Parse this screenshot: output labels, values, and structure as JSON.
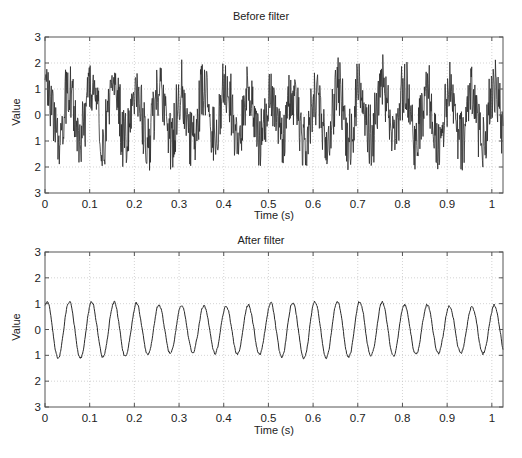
{
  "figure": {
    "width": 522,
    "height": 458,
    "line_color": "#2a2a2a",
    "axis_color": "#555555",
    "grid_color": "#c8c8c8"
  },
  "chart_data": [
    {
      "type": "line",
      "title": "Before filter",
      "xlabel": "Time (s)",
      "ylabel": "Value",
      "xlim": [
        0,
        1.025
      ],
      "ylim": [
        -3,
        3
      ],
      "xticks": [
        0,
        0.1,
        0.2,
        0.3,
        0.4,
        0.5,
        0.6,
        0.7,
        0.8,
        0.9,
        1
      ],
      "xtick_labels": [
        "0",
        "0.1",
        "0.2",
        "0.3",
        "0.4",
        "0.5",
        "0.6",
        "0.7",
        "0.8",
        "0.9",
        "1"
      ],
      "yticks": [
        3,
        2,
        1,
        0,
        -1,
        -2,
        -3
      ],
      "ytick_labels": [
        "3",
        "2",
        "1",
        "0",
        "1",
        "2",
        "3"
      ],
      "grid": true,
      "series": [
        {
          "name": "noisy signal",
          "description": "20 Hz sinusoid (amplitude ~1) plus broadband high-frequency noise (±~1.3)",
          "base_frequency_hz": 20,
          "amplitude": 1.0,
          "noise_amplitude": 1.25,
          "phase_rad": 0.0,
          "sample_rate_hz": 1000,
          "approx_range": [
            -2.8,
            2.6
          ],
          "x_sampled": [
            0.0,
            0.025,
            0.05,
            0.075,
            0.1,
            0.125,
            0.15,
            0.175,
            0.2,
            0.225,
            0.25
          ],
          "y_envelope_mean": [
            1.0,
            -1.0,
            1.0,
            -1.0,
            1.0,
            -1.0,
            1.0,
            -1.0,
            1.0,
            -1.0,
            1.0
          ]
        }
      ]
    },
    {
      "type": "line",
      "title": "After filter",
      "xlabel": "Time (s)",
      "ylabel": "Value",
      "xlim": [
        0,
        1.025
      ],
      "ylim": [
        -3,
        3
      ],
      "xticks": [
        0,
        0.1,
        0.2,
        0.3,
        0.4,
        0.5,
        0.6,
        0.7,
        0.8,
        0.9,
        1
      ],
      "xtick_labels": [
        "0",
        "0.1",
        "0.2",
        "0.3",
        "0.4",
        "0.5",
        "0.6",
        "0.7",
        "0.8",
        "0.9",
        "1"
      ],
      "yticks": [
        3,
        2,
        1,
        0,
        -1,
        -2,
        -3
      ],
      "ytick_labels": [
        "3",
        "2",
        "1",
        "0",
        "1",
        "2",
        "3"
      ],
      "grid": true,
      "series": [
        {
          "name": "filtered signal",
          "description": "Low-pass filtered: ~20 Hz sinusoid, amplitude ~1, small residual ripple",
          "base_frequency_hz": 20,
          "amplitude": 1.0,
          "noise_amplitude": 0.12,
          "phase_rad": 0.0,
          "sample_rate_hz": 1000,
          "approx_range": [
            -1.3,
            1.3
          ],
          "peak_times_s": [
            0.005,
            0.06,
            0.11,
            0.16,
            0.21,
            0.26,
            0.31,
            0.36,
            0.41,
            0.46,
            0.51,
            0.56,
            0.61,
            0.66,
            0.71,
            0.76,
            0.81,
            0.86,
            0.91,
            0.96,
            1.01
          ],
          "peak_values": [
            1.05,
            1.0,
            1.2,
            0.85,
            0.9,
            1.15,
            1.05,
            1.0,
            1.05,
            1.0,
            0.8,
            1.0,
            1.3,
            1.1,
            0.85,
            1.0,
            1.0,
            1.05,
            1.0,
            1.05,
            1.0
          ],
          "trough_values": [
            -1.1,
            -0.95,
            -0.9,
            -1.2,
            -0.95,
            -1.0,
            -1.0,
            -1.2,
            -1.3,
            -1.0,
            -0.95,
            -1.2,
            -1.2,
            -1.0,
            -1.05,
            -1.2,
            -1.05,
            -1.2,
            -0.95,
            -1.05
          ]
        }
      ]
    }
  ],
  "panels": [
    {
      "title": "Before filter",
      "xlabel": "Time (s)",
      "ylabel": "Value"
    },
    {
      "title": "After filter",
      "xlabel": "Time (s)",
      "ylabel": "Value"
    }
  ]
}
